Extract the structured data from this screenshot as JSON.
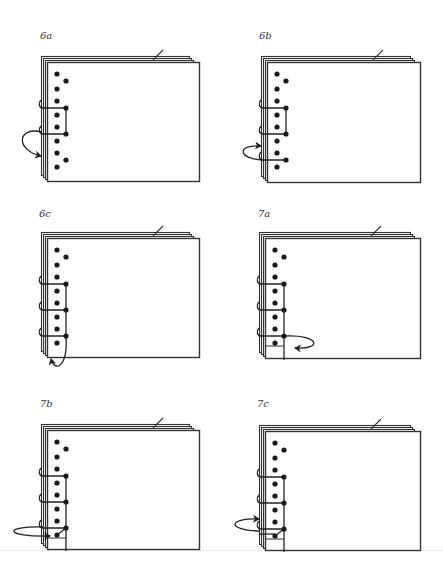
{
  "figure": {
    "colors": {
      "ink": "#222222",
      "sheet_edge": "#333333",
      "background": "#ffffff"
    },
    "panels": [
      {
        "id": "6a",
        "label": "6a",
        "x": 47,
        "y": 62,
        "w": 152,
        "h": 119,
        "label_x": 40,
        "label_y": 30,
        "step": "thread loops around spine from between 3rd stitch holes, arrow pointing into spine lower"
      },
      {
        "id": "6b",
        "label": "6b",
        "x": 267,
        "y": 62,
        "w": 153,
        "h": 120,
        "label_x": 259,
        "label_y": 30,
        "step": "third stitch added; arrow wraps around spine at lower hole"
      },
      {
        "id": "6c",
        "label": "6c",
        "x": 47,
        "y": 238,
        "w": 152,
        "h": 119,
        "label_x": 39,
        "label_y": 208,
        "step": "thread wraps under bottom edge, arrow pointing up"
      },
      {
        "id": "7a",
        "label": "7a",
        "x": 265,
        "y": 238,
        "w": 155,
        "h": 120,
        "label_x": 258,
        "label_y": 208,
        "step": "thread passes along bottom, arrow loops to the right back onto page"
      },
      {
        "id": "7b",
        "label": "7b",
        "x": 47,
        "y": 430,
        "w": 152,
        "h": 119,
        "label_x": 40,
        "label_y": 398,
        "step": "thread wraps around spine to bottom inner hole, arrow pointing right"
      },
      {
        "id": "7c",
        "label": "7c",
        "x": 265,
        "y": 431,
        "w": 155,
        "h": 119,
        "label_x": 257,
        "label_y": 398,
        "step": "thread looped around spine near bottom, arrow pointing into spine"
      }
    ],
    "holes": {
      "main_column_dx": 10,
      "main_column_dy": [
        12,
        27,
        39,
        53,
        65,
        79,
        91,
        105
      ],
      "second_column_dx": 19,
      "second_column_dy": [
        19,
        46,
        72,
        98
      ]
    }
  }
}
